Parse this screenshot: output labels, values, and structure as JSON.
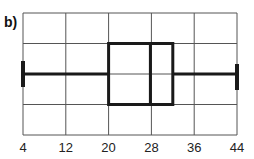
{
  "panel_label": "b)",
  "chart_data": {
    "type": "boxplot",
    "title": "",
    "xlabel": "",
    "ylabel": "",
    "x_ticks": [
      4,
      12,
      20,
      28,
      36,
      44
    ],
    "xlim": [
      4,
      44
    ],
    "grid": true,
    "grid_rows": 4,
    "box": {
      "min": 4,
      "q1": 20,
      "median": 28,
      "q3": 32,
      "max": 44
    },
    "colors": {
      "box": "#1a1a1a",
      "grid": "#555555"
    }
  }
}
